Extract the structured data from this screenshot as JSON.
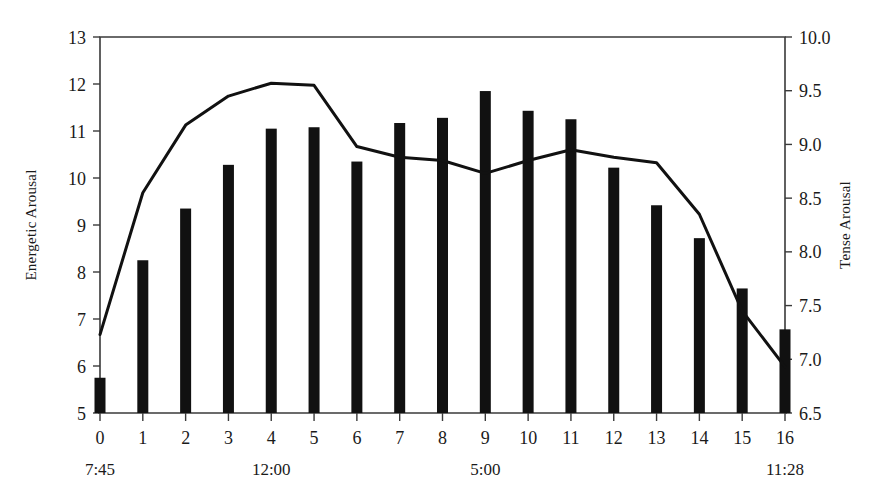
{
  "chart_data": {
    "type": "bar",
    "title": "",
    "subtitle": "",
    "xlabel": "",
    "grid": false,
    "legend": "none",
    "categories": [
      "0",
      "1",
      "2",
      "3",
      "4",
      "5",
      "6",
      "7",
      "8",
      "9",
      "10",
      "11",
      "12",
      "13",
      "14",
      "15",
      "16"
    ],
    "x_time_labels": [
      {
        "category": "0",
        "label": "7:45"
      },
      {
        "category": "4",
        "label": "12:00"
      },
      {
        "category": "9",
        "label": "5:00"
      },
      {
        "category": "16",
        "label": "11:28"
      }
    ],
    "left_axis": {
      "label": "Energetic Arousal",
      "ylim": [
        5,
        13
      ],
      "ticks": [
        "5",
        "6",
        "7",
        "8",
        "9",
        "10",
        "11",
        "12",
        "13"
      ],
      "tick_values": [
        5,
        6,
        7,
        8,
        9,
        10,
        11,
        12,
        13
      ]
    },
    "right_axis": {
      "label": "Tense Arousal",
      "ylim": [
        6.5,
        10.0
      ],
      "ticks": [
        "6.5",
        "7.0",
        "7.5",
        "8.0",
        "8.5",
        "9.0",
        "9.5",
        "10.0"
      ],
      "tick_values": [
        6.5,
        7.0,
        7.5,
        8.0,
        8.5,
        9.0,
        9.5,
        10.0
      ]
    },
    "series": [
      {
        "name": "Energetic Arousal",
        "type": "bar",
        "axis": "left",
        "color": "#111111",
        "values": [
          5.75,
          8.25,
          9.35,
          10.28,
          11.05,
          11.08,
          10.35,
          11.17,
          11.28,
          11.85,
          11.43,
          11.25,
          10.22,
          9.42,
          8.72,
          7.65,
          6.78
        ]
      },
      {
        "name": "Tense Arousal",
        "type": "line",
        "axis": "right",
        "color": "#111111",
        "values": [
          7.23,
          8.55,
          9.18,
          9.45,
          9.57,
          9.55,
          8.98,
          8.88,
          8.85,
          8.73,
          8.85,
          8.95,
          8.88,
          8.83,
          8.35,
          7.45,
          6.93
        ]
      }
    ]
  },
  "axis_labels": {
    "left": "Energetic Arousal",
    "right": "Tense Arousal"
  }
}
